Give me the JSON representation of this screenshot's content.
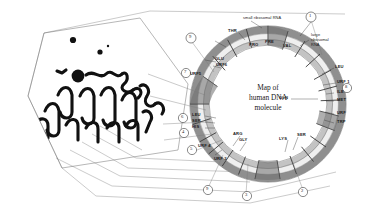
{
  "figure": {
    "center_title_line1": "Map of",
    "center_title_line2": "human DNA",
    "center_title_line3": "molecule"
  },
  "ring_labels": {
    "rna": [
      {
        "key": "small-ribosomal-rna",
        "text": "small ribosomal RNA"
      },
      {
        "key": "large-ribosomal-rna-1",
        "text": "large"
      },
      {
        "key": "large-ribosomal-rna-2",
        "text": "ribosomal"
      },
      {
        "key": "large-ribosomal-rna-3",
        "text": "RNA"
      }
    ],
    "genes_top": [
      {
        "key": "thr",
        "text": "THR"
      },
      {
        "key": "pro",
        "text": "PRO"
      },
      {
        "key": "pre",
        "text": "PRE"
      },
      {
        "key": "val",
        "text": "VAL"
      },
      {
        "key": "glu",
        "text": "GLU"
      }
    ],
    "genes_right": [
      {
        "key": "leu-right",
        "text": "LEU"
      },
      {
        "key": "urf1",
        "text": "URF 1"
      },
      {
        "key": "ile",
        "text": "ILE"
      },
      {
        "key": "met",
        "text": "MET"
      },
      {
        "key": "urf-right",
        "text": "URF"
      },
      {
        "key": "trp",
        "text": "TRP"
      },
      {
        "key": "gln",
        "text": "GLN"
      }
    ],
    "genes_left": [
      {
        "key": "urf5",
        "text": "URF5"
      },
      {
        "key": "urf6",
        "text": "URF6"
      },
      {
        "key": "leu-left",
        "text": "LEU"
      },
      {
        "key": "ser-left",
        "text": "SER"
      },
      {
        "key": "his",
        "text": "HIS"
      },
      {
        "key": "urf4",
        "text": "URF 4"
      },
      {
        "key": "urf3",
        "text": "URF 3"
      }
    ],
    "genes_bottom": [
      {
        "key": "arg",
        "text": "ARG"
      },
      {
        "key": "gly",
        "text": "GLY"
      },
      {
        "key": "lys",
        "text": "LYS"
      },
      {
        "key": "ser-bottom",
        "text": "SER"
      }
    ]
  },
  "callout_numbers": [
    {
      "key": "callout-1",
      "text": "1"
    },
    {
      "key": "callout-9-top",
      "text": "9"
    },
    {
      "key": "callout-8",
      "text": "8"
    },
    {
      "key": "callout-7",
      "text": "7"
    },
    {
      "key": "callout-6",
      "text": "6"
    },
    {
      "key": "callout-4",
      "text": "4"
    },
    {
      "key": "callout-5",
      "text": "5"
    },
    {
      "key": "callout-9-bottom",
      "text": "9"
    },
    {
      "key": "callout-3",
      "text": "3"
    },
    {
      "key": "callout-2",
      "text": "2"
    }
  ],
  "colors": {
    "ring_outer": "#8c8c8c",
    "ring_mid": "#d9d9d9",
    "ring_inner": "#b3b3b3",
    "ink": "#1a1a1a",
    "line": "#8a8a8a"
  }
}
